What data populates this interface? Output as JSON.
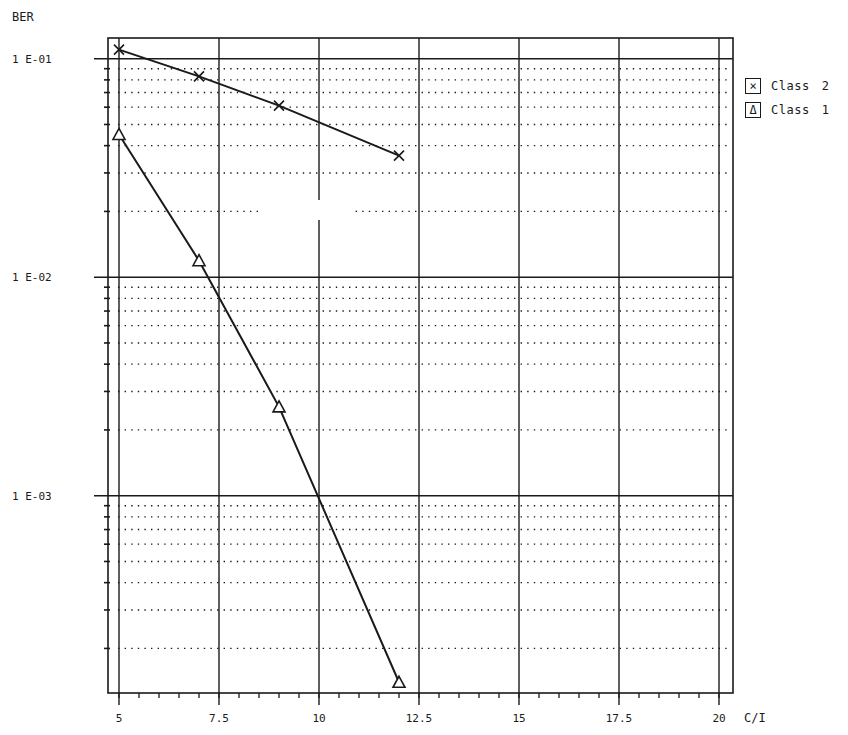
{
  "chart_data": {
    "type": "line",
    "title": "",
    "xlabel": "C/I",
    "ylabel": "BER",
    "yscale": "log",
    "xlim": [
      4.7,
      20.35
    ],
    "ylim": [
      0.000125,
      0.126
    ],
    "grid": true,
    "legend_position": "right-top",
    "x_ticks": [
      5,
      7.5,
      10,
      12.5,
      15,
      17.5,
      20
    ],
    "x_tick_labels": [
      "5",
      "7.5",
      "10",
      "12.5",
      "15",
      "17.5",
      "20"
    ],
    "y_ticks": [
      0.1,
      0.01,
      0.001
    ],
    "y_tick_labels": [
      "1 E-01",
      "1 E-02",
      "1 E-03"
    ],
    "series": [
      {
        "name": "Class 2",
        "marker": "x",
        "x": [
          5,
          7,
          9,
          12
        ],
        "values": [
          0.11,
          0.083,
          0.061,
          0.036
        ]
      },
      {
        "name": "Class 1",
        "marker": "triangle",
        "x": [
          5,
          7,
          9,
          12
        ],
        "values": [
          0.045,
          0.0119,
          0.00255,
          0.00014
        ]
      }
    ]
  },
  "axes": {
    "y_title": "BER",
    "x_title": "C/I"
  },
  "legend": {
    "items": [
      {
        "marker": "×",
        "name": "Class",
        "num": "2"
      },
      {
        "marker": "Δ",
        "name": "Class",
        "num": "1"
      }
    ]
  },
  "style": {
    "ink": "#1a1a1a",
    "background": "#ffffff"
  }
}
